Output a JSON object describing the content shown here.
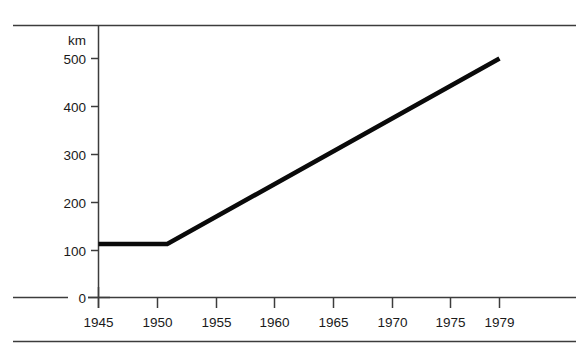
{
  "chart_data": {
    "type": "line",
    "title": "",
    "subtitle": "",
    "xlabel": "",
    "ylabel": "",
    "unit_label": "km",
    "x": [
      1945,
      1951,
      1979
    ],
    "values": [
      112,
      112,
      500
    ],
    "series": [
      {
        "name": "",
        "x": [
          1945,
          1951,
          1979
        ],
        "values": [
          112,
          112,
          500
        ]
      }
    ],
    "xlim": [
      1945,
      1979
    ],
    "ylim": [
      0,
      530
    ],
    "x_ticks": [
      1945,
      1950,
      1955,
      1960,
      1965,
      1970,
      1975,
      1979
    ],
    "x_tick_labels": [
      "1945",
      "1950",
      "1955",
      "1960",
      "1965",
      "1970",
      "1975",
      "1979"
    ],
    "y_ticks": [
      0,
      100,
      200,
      300,
      400,
      500
    ],
    "y_tick_labels": [
      "0",
      "100",
      "200",
      "300",
      "400",
      "500"
    ],
    "grid": false,
    "legend": false,
    "legend_position": "none",
    "annotations": [],
    "line_color": "#0a0a0a",
    "axis_color": "#3c3c3c",
    "background_color": "#ffffff"
  },
  "axes": {
    "unit": "km",
    "y_labels": [
      "500",
      "400",
      "300",
      "200",
      "100",
      "0"
    ],
    "x_labels": [
      "1945",
      "1950",
      "1955",
      "1960",
      "1965",
      "1970",
      "1975",
      "1979"
    ]
  }
}
